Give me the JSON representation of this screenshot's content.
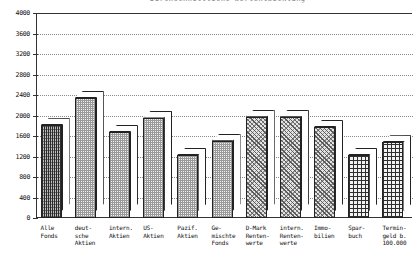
{
  "title_clipped": "Durchschnittliche Wertentwicklung",
  "chart_data": {
    "type": "bar",
    "title": "Durchschnittliche Wertentwicklung",
    "xlabel": "",
    "ylabel": "",
    "ylim": [
      0,
      4000
    ],
    "ytick_step": 400,
    "grid": true,
    "legend": "none",
    "style": "3d-bars",
    "ytick_labels": [
      "4000",
      "3600",
      "3200",
      "2800",
      "2400",
      "2000",
      "1600",
      "1200",
      "800",
      "400",
      "0"
    ],
    "ytick_values": [
      4000,
      3600,
      3200,
      2800,
      2400,
      2000,
      1600,
      1200,
      800,
      400,
      0
    ],
    "categories": [
      "Alle\nFonds",
      "deut-\nsche\nAktien",
      "intern.\nAktien",
      "US-\nAktien",
      "Pazif.\nAktien",
      "Ge-\nmischte\nFonds",
      "D-Mark\nRenten-\nwerte",
      "intern.\nRenten-\nwerte",
      "Immo-\nbilien",
      "Spar-\nbuch",
      "Termin-\ngeld b.\n100.000"
    ],
    "values": [
      1810,
      2340,
      1680,
      1960,
      1230,
      1510,
      1975,
      1975,
      1775,
      1230,
      1480
    ],
    "patterns": [
      "dense",
      "dots",
      "dots",
      "dots",
      "dots",
      "dots",
      "diag",
      "diag",
      "diag",
      "grid",
      "grid"
    ]
  },
  "axis": {
    "line_color": "#333333",
    "grid_color": "#8a8a8a",
    "bar_outline": "#222222"
  }
}
